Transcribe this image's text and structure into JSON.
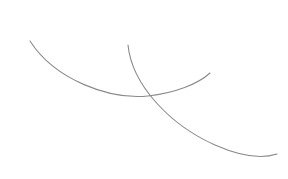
{
  "canvas": {
    "width": 288,
    "height": 179,
    "background": "#ffffff"
  },
  "curves": [
    {
      "id": "arc-1",
      "description": "upward-opening arc from upper-left to right",
      "path": "M 30 41 C 55 80, 110 100, 148 96 C 175 93, 198 84, 210 73",
      "stroke": "#8a8a8a",
      "stroke_width": 1.1
    },
    {
      "id": "arc-2",
      "description": "downward sweeping arc from top-center to lower-right",
      "path": "M 128 45 C 132 85, 170 125, 215 145 C 240 156, 262 159, 277 154",
      "stroke": "#8a8a8a",
      "stroke_width": 1.1
    }
  ]
}
